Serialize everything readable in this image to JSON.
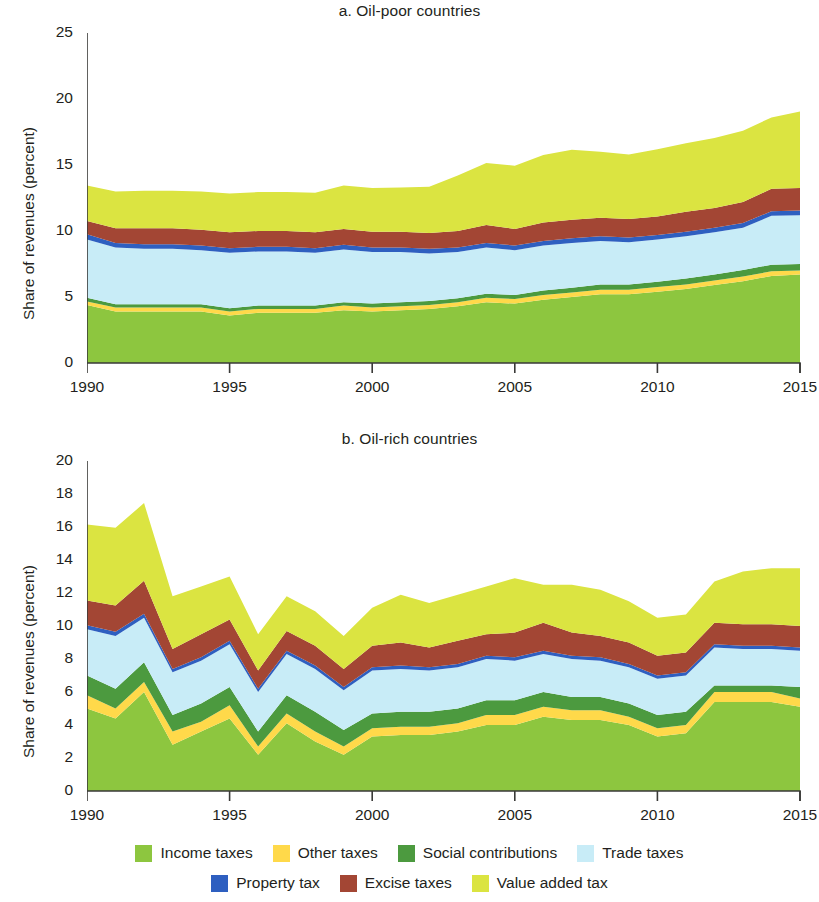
{
  "figure": {
    "ylabel": "Share of revenues (percent)"
  },
  "legend": {
    "rows": [
      [
        {
          "label": "Income taxes",
          "color": "#8dc63f",
          "icon": "legend-swatch-icon"
        },
        {
          "label": "Other taxes",
          "color": "#ffd94a",
          "icon": "legend-swatch-icon"
        },
        {
          "label": "Social contributions",
          "color": "#4c9a3f",
          "icon": "legend-swatch-icon"
        },
        {
          "label": "Trade taxes",
          "color": "#c8ecf7",
          "icon": "legend-swatch-icon"
        }
      ],
      [
        {
          "label": "Property tax",
          "color": "#2e5fc0",
          "icon": "legend-swatch-icon"
        },
        {
          "label": "Excise taxes",
          "color": "#a34634",
          "icon": "legend-swatch-icon"
        },
        {
          "label": "Value added tax",
          "color": "#dbe441",
          "icon": "legend-swatch-icon"
        }
      ]
    ]
  },
  "chart_data": [
    {
      "id": "panel-a",
      "type": "area",
      "stacked": true,
      "title": "a. Oil-poor countries",
      "xlabel": "",
      "ylabel": "Share of revenues (percent)",
      "xlim": [
        1990,
        2015
      ],
      "ylim": [
        0,
        25
      ],
      "yticks": [
        0,
        5,
        10,
        15,
        20,
        25
      ],
      "xticks": [
        1990,
        1995,
        2000,
        2005,
        2010,
        2015
      ],
      "grid": false,
      "legend_position": "bottom",
      "x": [
        1990,
        1991,
        1992,
        1993,
        1994,
        1995,
        1996,
        1997,
        1998,
        1999,
        2000,
        2001,
        2002,
        2003,
        2004,
        2005,
        2006,
        2007,
        2008,
        2009,
        2010,
        2011,
        2012,
        2013,
        2014,
        2015
      ],
      "series": [
        {
          "name": "Income taxes",
          "color": "#8dc63f",
          "values": [
            4.4,
            3.9,
            3.9,
            3.9,
            3.9,
            3.6,
            3.8,
            3.8,
            3.8,
            4.0,
            3.9,
            4.0,
            4.1,
            4.3,
            4.6,
            4.5,
            4.8,
            5.0,
            5.2,
            5.2,
            5.4,
            5.6,
            5.9,
            6.2,
            6.6,
            6.7
          ]
        },
        {
          "name": "Other taxes",
          "color": "#ffd94a",
          "values": [
            0.25,
            0.3,
            0.3,
            0.3,
            0.3,
            0.3,
            0.3,
            0.3,
            0.3,
            0.35,
            0.3,
            0.3,
            0.3,
            0.3,
            0.35,
            0.35,
            0.35,
            0.35,
            0.35,
            0.35,
            0.35,
            0.35,
            0.35,
            0.35,
            0.35,
            0.3
          ]
        },
        {
          "name": "Social contributions",
          "color": "#4c9a3f",
          "values": [
            0.3,
            0.25,
            0.25,
            0.25,
            0.25,
            0.25,
            0.25,
            0.25,
            0.25,
            0.25,
            0.3,
            0.3,
            0.3,
            0.3,
            0.3,
            0.3,
            0.35,
            0.35,
            0.4,
            0.4,
            0.4,
            0.45,
            0.45,
            0.5,
            0.5,
            0.5
          ]
        },
        {
          "name": "Trade taxes",
          "color": "#c8ecf7",
          "values": [
            4.4,
            4.3,
            4.2,
            4.2,
            4.1,
            4.2,
            4.1,
            4.1,
            4.0,
            4.0,
            3.9,
            3.8,
            3.6,
            3.5,
            3.5,
            3.4,
            3.4,
            3.4,
            3.3,
            3.2,
            3.2,
            3.2,
            3.2,
            3.2,
            3.7,
            3.7
          ]
        },
        {
          "name": "Property tax",
          "color": "#2e5fc0",
          "values": [
            0.4,
            0.35,
            0.35,
            0.35,
            0.35,
            0.35,
            0.35,
            0.35,
            0.35,
            0.35,
            0.35,
            0.35,
            0.35,
            0.35,
            0.35,
            0.35,
            0.35,
            0.35,
            0.35,
            0.35,
            0.35,
            0.35,
            0.35,
            0.35,
            0.35,
            0.35
          ]
        },
        {
          "name": "Excise taxes",
          "color": "#a34634",
          "values": [
            1.0,
            1.1,
            1.2,
            1.2,
            1.2,
            1.2,
            1.2,
            1.2,
            1.2,
            1.2,
            1.2,
            1.2,
            1.2,
            1.25,
            1.35,
            1.25,
            1.4,
            1.4,
            1.4,
            1.4,
            1.4,
            1.5,
            1.5,
            1.6,
            1.7,
            1.7
          ]
        },
        {
          "name": "Value added tax",
          "color": "#dbe441",
          "values": [
            2.7,
            2.8,
            2.85,
            2.85,
            2.9,
            2.95,
            2.95,
            2.95,
            3.0,
            3.3,
            3.3,
            3.35,
            3.5,
            4.2,
            4.7,
            4.8,
            5.1,
            5.3,
            5.0,
            4.9,
            5.1,
            5.2,
            5.3,
            5.4,
            5.4,
            5.8
          ]
        }
      ]
    },
    {
      "id": "panel-b",
      "type": "area",
      "stacked": true,
      "title": "b. Oil-rich countries",
      "xlabel": "",
      "ylabel": "Share of revenues (percent)",
      "xlim": [
        1990,
        2015
      ],
      "ylim": [
        0,
        20
      ],
      "yticks": [
        0,
        2,
        4,
        6,
        8,
        10,
        12,
        14,
        16,
        18,
        20
      ],
      "xticks": [
        1990,
        1995,
        2000,
        2005,
        2010,
        2015
      ],
      "grid": false,
      "legend_position": "bottom",
      "x": [
        1990,
        1991,
        1992,
        1993,
        1994,
        1995,
        1996,
        1997,
        1998,
        1999,
        2000,
        2001,
        2002,
        2003,
        2004,
        2005,
        2006,
        2007,
        2008,
        2009,
        2010,
        2011,
        2012,
        2013,
        2014,
        2015
      ],
      "series": [
        {
          "name": "Income taxes",
          "color": "#8dc63f",
          "values": [
            5.0,
            4.4,
            6.0,
            2.8,
            3.6,
            4.4,
            2.2,
            4.1,
            3.0,
            2.2,
            3.3,
            3.4,
            3.4,
            3.6,
            4.0,
            4.0,
            4.5,
            4.3,
            4.3,
            4.0,
            3.3,
            3.5,
            5.4,
            5.4,
            5.4,
            5.1
          ]
        },
        {
          "name": "Other taxes",
          "color": "#ffd94a",
          "values": [
            0.8,
            0.6,
            0.6,
            0.8,
            0.6,
            0.8,
            0.5,
            0.6,
            0.6,
            0.5,
            0.5,
            0.5,
            0.5,
            0.5,
            0.6,
            0.6,
            0.6,
            0.6,
            0.6,
            0.5,
            0.5,
            0.5,
            0.6,
            0.6,
            0.6,
            0.5
          ]
        },
        {
          "name": "Social contributions",
          "color": "#4c9a3f",
          "values": [
            1.2,
            1.2,
            1.2,
            1.0,
            1.1,
            1.1,
            0.9,
            1.1,
            1.2,
            1.0,
            0.9,
            0.9,
            0.9,
            0.9,
            0.9,
            0.9,
            0.9,
            0.8,
            0.8,
            0.8,
            0.8,
            0.8,
            0.4,
            0.4,
            0.4,
            0.7
          ]
        },
        {
          "name": "Trade taxes",
          "color": "#c8ecf7",
          "values": [
            2.8,
            3.2,
            2.7,
            2.6,
            2.6,
            2.6,
            2.4,
            2.5,
            2.6,
            2.4,
            2.6,
            2.6,
            2.5,
            2.5,
            2.5,
            2.4,
            2.3,
            2.3,
            2.2,
            2.2,
            2.2,
            2.2,
            2.3,
            2.2,
            2.2,
            2.2
          ]
        },
        {
          "name": "Property tax",
          "color": "#2e5fc0",
          "values": [
            0.25,
            0.25,
            0.25,
            0.2,
            0.2,
            0.2,
            0.2,
            0.2,
            0.2,
            0.2,
            0.2,
            0.2,
            0.2,
            0.2,
            0.2,
            0.2,
            0.2,
            0.2,
            0.2,
            0.2,
            0.2,
            0.2,
            0.2,
            0.2,
            0.2,
            0.2
          ]
        },
        {
          "name": "Excise taxes",
          "color": "#a34634",
          "values": [
            1.5,
            1.6,
            2.0,
            1.2,
            1.4,
            1.3,
            1.1,
            1.2,
            1.2,
            1.1,
            1.3,
            1.4,
            1.2,
            1.4,
            1.3,
            1.5,
            1.7,
            1.4,
            1.3,
            1.3,
            1.2,
            1.2,
            1.3,
            1.3,
            1.3,
            1.3
          ]
        },
        {
          "name": "Value added tax",
          "color": "#dbe441",
          "values": [
            4.6,
            4.7,
            4.7,
            3.2,
            2.9,
            2.6,
            2.2,
            2.1,
            2.1,
            2.0,
            2.3,
            2.9,
            2.7,
            2.8,
            2.9,
            3.3,
            2.3,
            2.9,
            2.8,
            2.5,
            2.3,
            2.3,
            2.5,
            3.2,
            3.4,
            3.5
          ]
        }
      ]
    }
  ]
}
